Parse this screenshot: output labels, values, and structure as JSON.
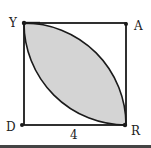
{
  "diagram": {
    "type": "geometry",
    "shape": "square with two quarter-circle arcs",
    "vertices": {
      "top_left": "Y",
      "top_right": "A",
      "bottom_left": "D",
      "bottom_right": "R"
    },
    "side_label": "4",
    "shaded_region": "lens between arcs from Y to R",
    "colors": {
      "stroke": "#1a1a1a",
      "shade": "#d4d4d4"
    }
  }
}
